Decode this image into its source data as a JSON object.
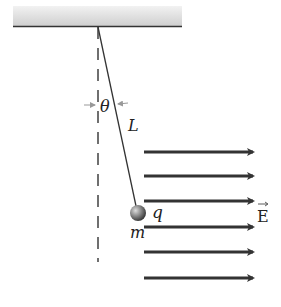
{
  "diagram": {
    "labels": {
      "angle": "θ",
      "length": "L",
      "charge": "q",
      "mass": "m",
      "field": "E"
    },
    "ceiling": {
      "x1": 13,
      "x2": 182,
      "y": 26
    },
    "pivot": {
      "x": 98,
      "y": 27
    },
    "bob": {
      "x": 138,
      "y": 213,
      "r": 8
    },
    "field_arrows": {
      "x1": 144,
      "x2": 253,
      "y": [
        152,
        176,
        201,
        227,
        252,
        278
      ],
      "color": "#333333"
    },
    "colors": {
      "line": "#333333",
      "ceiling_fill": "#d9d9d9",
      "angle_arrows": "#999999"
    }
  }
}
